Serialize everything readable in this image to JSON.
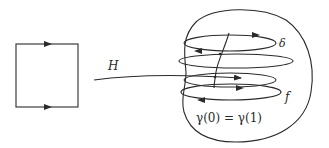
{
  "diagram": {
    "title": "",
    "map_label": "H",
    "loop_labels": {
      "top": "δ",
      "bottom": "f"
    },
    "equation": "γ(0) = γ(1)",
    "colors": {
      "stroke": "#2a2a2a",
      "background": "#ffffff"
    },
    "nodes": [
      {
        "id": "square",
        "shape": "square",
        "edge_arrows": [
          "top-right",
          "bottom-right"
        ]
      },
      {
        "id": "blob",
        "shape": "closed-curve",
        "contents": "stacked oriented loops joined by a vertical path"
      }
    ],
    "edges": [
      {
        "from": "square",
        "to": "blob",
        "label": "H"
      }
    ]
  }
}
